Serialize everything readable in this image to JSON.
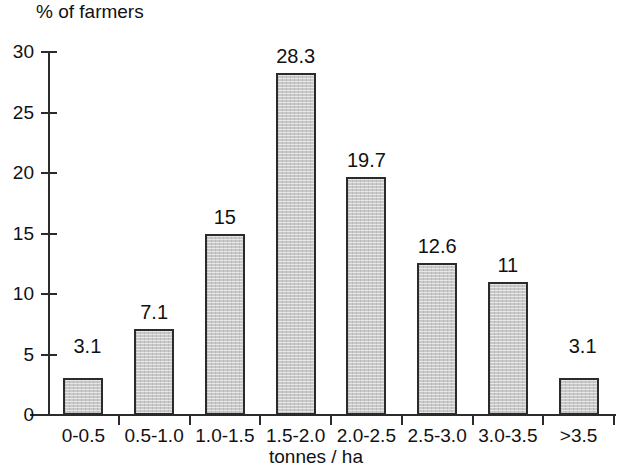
{
  "chart_data": {
    "type": "bar",
    "title": "",
    "xlabel": "tonnes / ha",
    "ylabel": "% of farmers",
    "categories": [
      "0-0.5",
      "0.5-1.0",
      "1.0-1.5",
      "1.5-2.0",
      "2.0-2.5",
      "2.5-3.0",
      "3.0-3.5",
      ">3.5"
    ],
    "values": [
      3.1,
      7.1,
      15,
      28.3,
      19.7,
      12.6,
      11,
      3.1
    ],
    "value_labels": [
      "3.1",
      "7.1",
      "15",
      "28.3",
      "19.7",
      "12.6",
      "11",
      "3.1"
    ],
    "ylim": [
      0,
      30
    ],
    "ytick_values": [
      0,
      5,
      10,
      15,
      20,
      25,
      30
    ],
    "ytick_labels": [
      "0",
      "5",
      "10",
      "15",
      "20",
      "25",
      "30"
    ],
    "grid": false,
    "legend": null,
    "bar_fill_color": "#c9c9c9",
    "bar_border_color": "#2b2b2b",
    "axis_color": "#2b2b2b",
    "background_color": "#ffffff"
  }
}
